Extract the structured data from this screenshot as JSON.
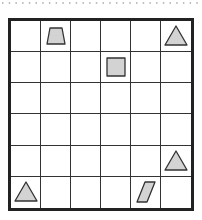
{
  "grid": {
    "rows": 6,
    "cols": 6,
    "shape_fill": "#d3d3d3",
    "shape_stroke": "#333333",
    "shapes": [
      {
        "row": 0,
        "col": 1,
        "type": "trapezoid"
      },
      {
        "row": 0,
        "col": 5,
        "type": "triangle"
      },
      {
        "row": 1,
        "col": 3,
        "type": "square"
      },
      {
        "row": 4,
        "col": 5,
        "type": "triangle"
      },
      {
        "row": 5,
        "col": 0,
        "type": "triangle"
      },
      {
        "row": 5,
        "col": 4,
        "type": "parallelogram"
      }
    ]
  }
}
